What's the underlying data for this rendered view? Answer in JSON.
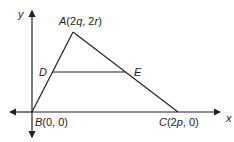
{
  "diagram": {
    "type": "coordinate-geometry-triangle",
    "axes": {
      "x_label": "x",
      "y_label": "y"
    },
    "points": {
      "A": {
        "name": "A",
        "coords": "(2q, 2r)",
        "label_pre": "A(2",
        "label_q": "q",
        "label_mid": ", 2",
        "label_r": "r",
        "label_post": ")"
      },
      "B": {
        "name": "B",
        "coords": "(0, 0)",
        "label_rest": "(0, 0)"
      },
      "C": {
        "name": "C",
        "coords": "(2p, 0)",
        "label_pre": "(2",
        "label_p": "p",
        "label_post": ", 0)"
      },
      "D": {
        "name": "D"
      },
      "E": {
        "name": "E"
      }
    },
    "segments": [
      "AB",
      "AC",
      "BC",
      "DE"
    ],
    "note": "DE is parallel to BC"
  }
}
